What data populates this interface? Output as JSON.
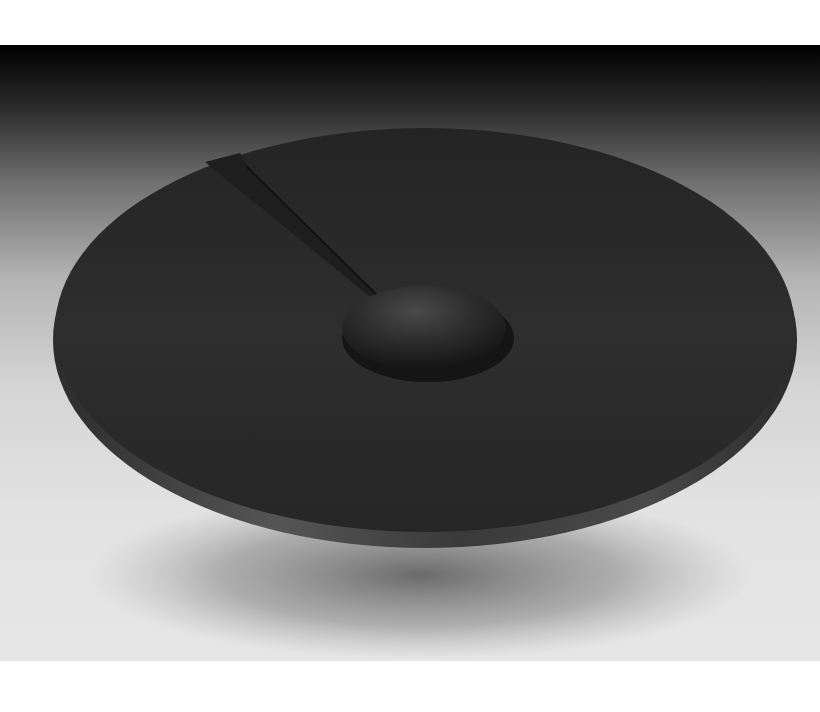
{
  "image": {
    "subject": "dark turned wooden platter with a raised central dome and a cut wedge notch near the upper left rim",
    "background": "studio gradient from black at top to light gray",
    "colors": {
      "page_background": "#ffffff",
      "backdrop_top": "#000000",
      "backdrop_bottom": "#e4e4e4",
      "plate_surface": "#2a2a2a",
      "plate_rim": "#3a3a3a",
      "shadow": "#7a7a7a"
    }
  }
}
